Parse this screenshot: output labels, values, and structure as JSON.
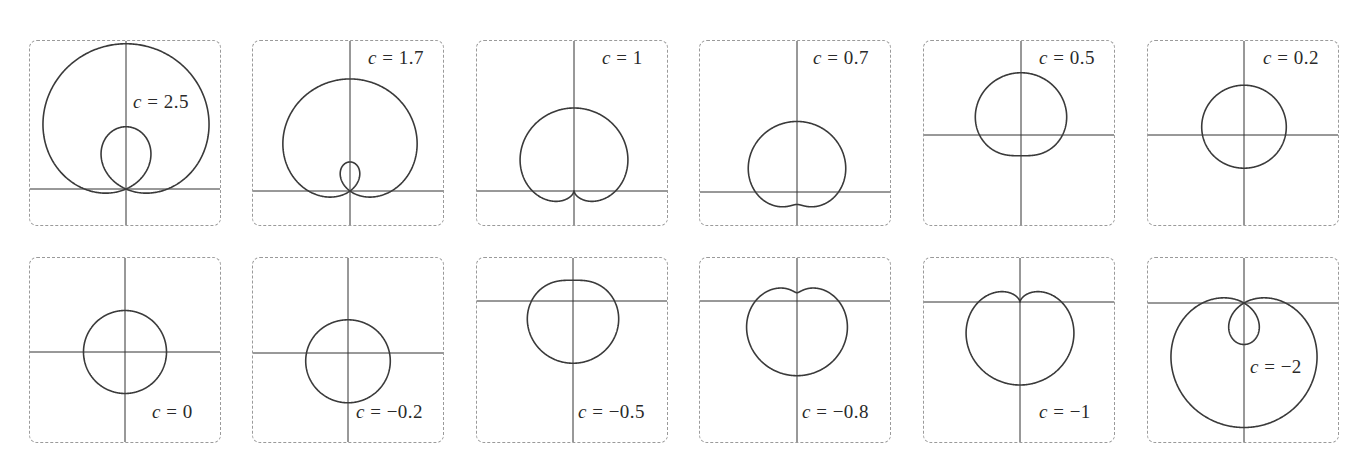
{
  "chart_data": {
    "type": "line",
    "title": "",
    "equation": "r = 1 + c sin(theta)",
    "xlabel": "",
    "ylabel": "",
    "grid": false,
    "legend": null,
    "scale_px_per_unit": 41.5,
    "panels": [
      {
        "c": 2.5,
        "label_var": "c",
        "label_rest": " = 2.5",
        "left": 29,
        "top": 40,
        "origin_x": 96,
        "origin_y": 148,
        "label_x": 103,
        "label_y": 50
      },
      {
        "c": 1.7,
        "label_var": "c",
        "label_rest": " = 1.7",
        "left": 252,
        "top": 40,
        "origin_x": 97,
        "origin_y": 150,
        "label_x": 115,
        "label_y": 6
      },
      {
        "c": 1,
        "label_var": "c",
        "label_rest": " = 1",
        "left": 476,
        "top": 40,
        "origin_x": 97,
        "origin_y": 150,
        "label_x": 125,
        "label_y": 6
      },
      {
        "c": 0.7,
        "label_var": "c",
        "label_rest": " = 0.7",
        "left": 699,
        "top": 40,
        "origin_x": 97,
        "origin_y": 151,
        "label_x": 113,
        "label_y": 6
      },
      {
        "c": 0.5,
        "label_var": "c",
        "label_rest": " = 0.5",
        "left": 923,
        "top": 40,
        "origin_x": 97,
        "origin_y": 94,
        "label_x": 115,
        "label_y": 6
      },
      {
        "c": 0.2,
        "label_var": "c",
        "label_rest": " = 0.2",
        "left": 1147,
        "top": 40,
        "origin_x": 96,
        "origin_y": 94,
        "label_x": 115,
        "label_y": 6
      },
      {
        "c": 0,
        "label_var": "c",
        "label_rest": " = 0",
        "left": 29,
        "top": 257,
        "origin_x": 95,
        "origin_y": 94,
        "label_x": 122,
        "label_y": 143
      },
      {
        "c": -0.2,
        "label_var": "c",
        "label_rest": " = −0.2",
        "left": 252,
        "top": 257,
        "origin_x": 95,
        "origin_y": 95,
        "label_x": 103,
        "label_y": 143
      },
      {
        "c": -0.5,
        "label_var": "c",
        "label_rest": " = −0.5",
        "left": 476,
        "top": 257,
        "origin_x": 96,
        "origin_y": 43,
        "label_x": 101,
        "label_y": 143
      },
      {
        "c": -0.8,
        "label_var": "c",
        "label_rest": " = −0.8",
        "left": 699,
        "top": 257,
        "origin_x": 97,
        "origin_y": 43,
        "label_x": 102,
        "label_y": 143
      },
      {
        "c": -1,
        "label_var": "c",
        "label_rest": " = −1",
        "left": 923,
        "top": 257,
        "origin_x": 96,
        "origin_y": 44,
        "label_x": 115,
        "label_y": 143
      },
      {
        "c": -2,
        "label_var": "c",
        "label_rest": " = −2",
        "left": 1147,
        "top": 257,
        "origin_x": 96,
        "origin_y": 45,
        "label_x": 102,
        "label_y": 98
      }
    ],
    "colors": {
      "curve": "#3a3a3a",
      "axis": "#333333",
      "border": "#9a9a9a"
    }
  }
}
